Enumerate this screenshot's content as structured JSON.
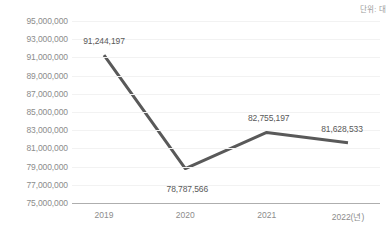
{
  "chart_data": {
    "type": "line",
    "title": "",
    "subtitle": "",
    "unit_note": "단위: 대",
    "xlabel": "",
    "ylabel": "",
    "categories": [
      "2019",
      "2020",
      "2021",
      "2022(년)"
    ],
    "values": [
      91244197,
      78787566,
      82755197,
      81628533
    ],
    "point_labels": [
      "91,244,197",
      "78,787,566",
      "82,755,197",
      "81,628,533"
    ],
    "series": [
      {
        "name": "",
        "values": [
          91244197,
          78787566,
          82755197,
          81628533
        ],
        "color": "#595959"
      }
    ],
    "ylim": [
      75000000,
      95000000
    ],
    "ytick_step": 2000000,
    "ytick_labels": [
      "95,000,000",
      "93,000,000",
      "91,000,000",
      "89,000,000",
      "87,000,000",
      "85,000,000",
      "83,000,000",
      "81,000,000",
      "79,000,000",
      "77,000,000",
      "75,000,000"
    ],
    "ytick_values": [
      95000000,
      93000000,
      91000000,
      89000000,
      87000000,
      85000000,
      83000000,
      81000000,
      79000000,
      77000000,
      75000000
    ],
    "grid": true,
    "grid_color": "#f2f2f2",
    "axis_color": "#aeaeae",
    "legend": false,
    "legend_position": "none",
    "markers": false,
    "line_width": 3,
    "label_color": "#595959",
    "tick_color": "#8c8c8c",
    "background": "#ffffff"
  }
}
